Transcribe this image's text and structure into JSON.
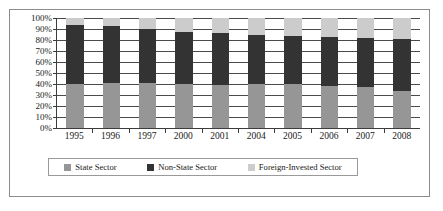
{
  "chart_data": {
    "type": "bar",
    "subtype": "stacked-percentage",
    "title": "",
    "xlabel": "",
    "ylabel": "",
    "ylim": [
      0,
      100
    ],
    "y_ticks": [
      0,
      10,
      20,
      30,
      40,
      50,
      60,
      70,
      80,
      90,
      100
    ],
    "y_tick_labels": [
      "0%",
      "10%",
      "20%",
      "30%",
      "40%",
      "50%",
      "60%",
      "70%",
      "80%",
      "90%",
      "100%"
    ],
    "grid": true,
    "legend_position": "bottom",
    "categories": [
      "1995",
      "1996",
      "1997",
      "2000",
      "2001",
      "2004",
      "2005",
      "2006",
      "2007",
      "2008"
    ],
    "series": [
      {
        "name": "State Sector",
        "color": "#969696",
        "values": [
          40,
          41,
          41,
          40,
          39,
          40,
          40,
          38,
          37,
          34
        ]
      },
      {
        "name": "Non-State Sector",
        "color": "#333333",
        "values": [
          54,
          52,
          49,
          47,
          47,
          45,
          44,
          45,
          45,
          47
        ]
      },
      {
        "name": "Foreign-Invested Sector",
        "color": "#cccccc",
        "values": [
          6,
          7,
          10,
          13,
          14,
          15,
          16,
          17,
          18,
          19
        ]
      }
    ],
    "cumulative_tops": {
      "state": [
        40,
        41,
        41,
        40,
        39,
        40,
        40,
        38,
        37,
        34
      ],
      "non_state": [
        94,
        93,
        90,
        87,
        86,
        85,
        84,
        83,
        82,
        81
      ],
      "foreign": [
        100,
        100,
        100,
        100,
        100,
        100,
        100,
        100,
        100,
        100
      ]
    }
  },
  "legend": {
    "items": [
      {
        "label": "State Sector",
        "color": "#969696"
      },
      {
        "label": "Non-State Sector",
        "color": "#333333"
      },
      {
        "label": "Foreign-Invested Sector",
        "color": "#cccccc"
      }
    ]
  }
}
